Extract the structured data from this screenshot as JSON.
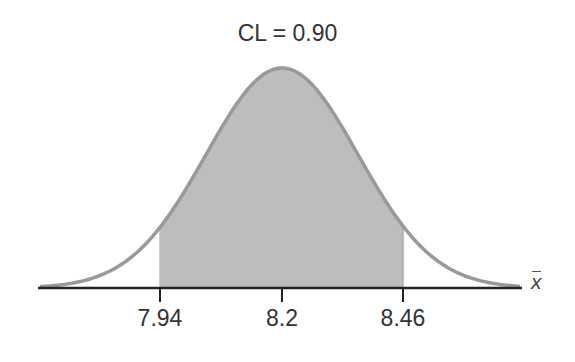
{
  "chart_data": {
    "type": "area",
    "title": "CL = 0.90",
    "xlabel": "x̄",
    "ylabel": "",
    "distribution": "normal",
    "mean": 8.2,
    "confidence_level": 0.9,
    "interval": [
      7.94,
      8.46
    ],
    "shaded_region": {
      "from": 7.94,
      "to": 8.46,
      "label": "90% confidence interval"
    },
    "tick_labels": [
      "7.94",
      "8.2",
      "8.46"
    ],
    "tick_values": [
      7.94,
      8.2,
      8.46
    ],
    "grid": false,
    "legend": null
  },
  "colors": {
    "curve": "#999999",
    "fill": "#bdbdbd",
    "axis": "#222222",
    "text": "#333333"
  },
  "labels": {
    "title": "CL = 0.90",
    "xlabel": "x",
    "ticks": [
      "7.94",
      "8.2",
      "8.46"
    ]
  }
}
